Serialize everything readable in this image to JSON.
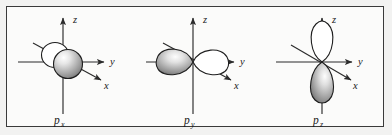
{
  "figure": {
    "kind": "atomic-orbital-diagram",
    "background_color": "#f2f2f1",
    "panel_color": "#fbfbfa",
    "border_color": "#3a3a3a",
    "ink_color": "#1e1e1e",
    "panels": [
      {
        "id": "px",
        "label_base": "p",
        "label_sub": "x",
        "caption": "px",
        "lobe_orientation": "x-axis (diagonal, toward viewer)",
        "front_lobe_style": "filled-shaded-sphere",
        "back_lobe_style": "open-outline-circle",
        "axes": [
          {
            "name": "z",
            "label": "z",
            "direction": "up"
          },
          {
            "name": "y",
            "label": "y",
            "direction": "right"
          },
          {
            "name": "x",
            "label": "x",
            "direction": "diagonal-down-right"
          }
        ]
      },
      {
        "id": "py",
        "label_base": "p",
        "label_sub": "y",
        "caption": "py",
        "lobe_orientation": "y-axis (horizontal)",
        "front_lobe_style": "filled-shaded-teardrop-left",
        "back_lobe_style": "open-outline-teardrop-right",
        "axes": [
          {
            "name": "z",
            "label": "z",
            "direction": "up"
          },
          {
            "name": "y",
            "label": "y",
            "direction": "right"
          },
          {
            "name": "x",
            "label": "x",
            "direction": "diagonal-down-right"
          }
        ]
      },
      {
        "id": "pz",
        "label_base": "p",
        "label_sub": "z",
        "caption": "pz",
        "lobe_orientation": "z-axis (vertical)",
        "front_lobe_style": "filled-shaded-teardrop-bottom",
        "back_lobe_style": "open-outline-teardrop-top",
        "axes": [
          {
            "name": "z",
            "label": "z",
            "direction": "up"
          },
          {
            "name": "y",
            "label": "y",
            "direction": "right"
          },
          {
            "name": "x",
            "label": "x",
            "direction": "diagonal-down-right"
          }
        ]
      }
    ]
  }
}
